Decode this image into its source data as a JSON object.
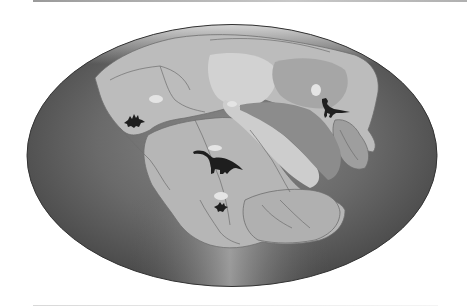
{
  "figure": {
    "title": "Pangaea paleogeographic map with dinosaur fossil locations",
    "projection": "elliptical (Mollweide-style)",
    "colors": {
      "ocean_dark": "#4a4a4a",
      "ocean_light": "#a8a8a8",
      "land": "#b4b4b4",
      "land_light": "#cfcfcf",
      "highlands": "#9a9a9a",
      "coastline": "#6e6e6e",
      "dinosaur": "#1e1e1e",
      "background": "#ffffff"
    },
    "dinosaurs": [
      {
        "name": "stegosaur-silhouette",
        "region": "western North America"
      },
      {
        "name": "sauropod-silhouette",
        "region": "northern South America / Africa"
      },
      {
        "name": "small-dinosaur-silhouette",
        "region": "southern South America"
      },
      {
        "name": "theropod-silhouette",
        "region": "eastern Asia"
      }
    ]
  }
}
